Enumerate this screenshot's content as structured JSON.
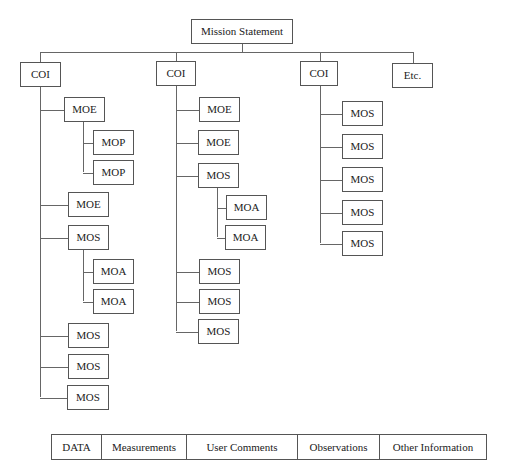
{
  "diagram": {
    "root": {
      "label": "Mission Statement",
      "x": 191,
      "y": 19,
      "w": 102,
      "h": 25
    },
    "top_bar": {
      "y": 52,
      "x1": 40,
      "x2": 413
    },
    "columns": [
      {
        "label": "COI",
        "x": 20,
        "y": 62,
        "w": 41,
        "h": 25,
        "stem_x": 40,
        "stem_end": 397,
        "children": [
          {
            "label": "MOE",
            "x": 64,
            "y": 97,
            "w": 41,
            "h": 25,
            "sub_stem_x": 83,
            "sub_stem_end": 172,
            "children": [
              {
                "label": "MOP",
                "x": 93,
                "y": 130,
                "w": 41,
                "h": 25
              },
              {
                "label": "MOP",
                "x": 93,
                "y": 160,
                "w": 41,
                "h": 25
              }
            ]
          },
          {
            "label": "MOE",
            "x": 68,
            "y": 192,
            "w": 41,
            "h": 25
          },
          {
            "label": "MOS",
            "x": 68,
            "y": 225,
            "w": 41,
            "h": 25,
            "sub_stem_x": 83,
            "sub_stem_end": 301,
            "children": [
              {
                "label": "MOA",
                "x": 93,
                "y": 259,
                "w": 41,
                "h": 25
              },
              {
                "label": "MOA",
                "x": 93,
                "y": 289,
                "w": 41,
                "h": 25
              }
            ]
          },
          {
            "label": "MOS",
            "x": 68,
            "y": 323,
            "w": 41,
            "h": 25
          },
          {
            "label": "MOS",
            "x": 68,
            "y": 354,
            "w": 41,
            "h": 25
          },
          {
            "label": "MOS",
            "x": 67,
            "y": 385,
            "w": 42,
            "h": 25
          }
        ]
      },
      {
        "label": "COI",
        "x": 156,
        "y": 61,
        "w": 40,
        "h": 25,
        "stem_x": 176,
        "stem_end": 331,
        "children": [
          {
            "label": "MOE",
            "x": 199,
            "y": 97,
            "w": 41,
            "h": 25
          },
          {
            "label": "MOE",
            "x": 198,
            "y": 130,
            "w": 41,
            "h": 25
          },
          {
            "label": "MOS",
            "x": 198,
            "y": 163,
            "w": 41,
            "h": 25,
            "sub_stem_x": 217,
            "sub_stem_end": 237,
            "children": [
              {
                "label": "MOA",
                "x": 226,
                "y": 195,
                "w": 41,
                "h": 25
              },
              {
                "label": "MOA",
                "x": 225,
                "y": 225,
                "w": 41,
                "h": 25
              }
            ]
          },
          {
            "label": "MOS",
            "x": 199,
            "y": 259,
            "w": 41,
            "h": 25
          },
          {
            "label": "MOS",
            "x": 199,
            "y": 289,
            "w": 41,
            "h": 25
          },
          {
            "label": "MOS",
            "x": 198,
            "y": 319,
            "w": 41,
            "h": 25
          }
        ]
      },
      {
        "label": "COI",
        "x": 300,
        "y": 61,
        "w": 38,
        "h": 25,
        "stem_x": 320,
        "stem_end": 243,
        "children": [
          {
            "label": "MOS",
            "x": 342,
            "y": 101,
            "w": 41,
            "h": 25
          },
          {
            "label": "MOS",
            "x": 342,
            "y": 134,
            "w": 41,
            "h": 25
          },
          {
            "label": "MOS",
            "x": 342,
            "y": 167,
            "w": 41,
            "h": 25
          },
          {
            "label": "MOS",
            "x": 342,
            "y": 200,
            "w": 41,
            "h": 25
          },
          {
            "label": "MOS",
            "x": 342,
            "y": 231,
            "w": 41,
            "h": 25
          }
        ]
      },
      {
        "label": "Etc.",
        "x": 392,
        "y": 63,
        "w": 41,
        "h": 25,
        "stem_x": 413,
        "stem_end": null,
        "children": []
      }
    ]
  },
  "data_table": {
    "cells": [
      {
        "label": "DATA",
        "width": 50
      },
      {
        "label": "Measurements",
        "width": 85
      },
      {
        "label": "User Comments",
        "width": 111
      },
      {
        "label": "Observations",
        "width": 82
      },
      {
        "label": "Other Information",
        "width": 108
      }
    ]
  },
  "colors": {
    "line": "#666666",
    "border": "#555555",
    "text": "#222222",
    "background": "#ffffff"
  }
}
